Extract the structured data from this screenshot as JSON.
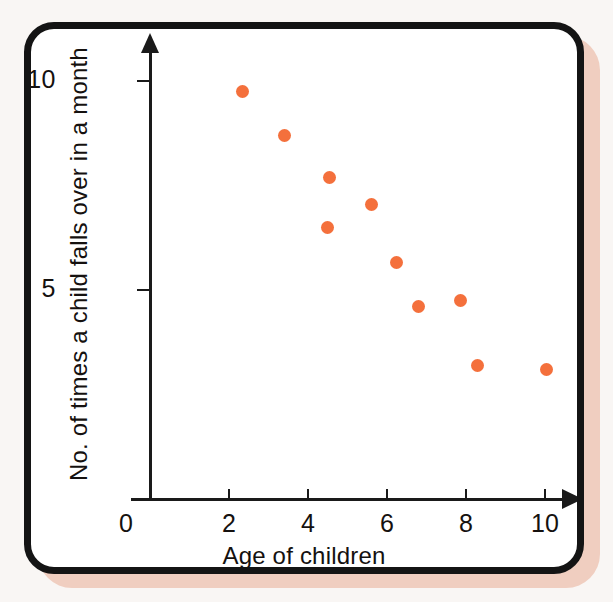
{
  "figure": {
    "frame_color": "#141414",
    "shadow_color": "#f0cec0",
    "background_color": "#f9f6f4",
    "plot_background": "#ffffff"
  },
  "chart_data": {
    "type": "scatter",
    "title": "",
    "xlabel": "Age of children",
    "ylabel": "No. of times a child falls over in a month",
    "xlim": [
      0,
      11.2
    ],
    "ylim": [
      0,
      10.8
    ],
    "xticks": [
      0,
      2,
      4,
      6,
      8,
      10
    ],
    "xticklabels": [
      "0",
      "2",
      "4",
      "6",
      "8",
      "10"
    ],
    "yticks": [
      5,
      10
    ],
    "yticklabels": [
      "5",
      "10"
    ],
    "grid": false,
    "legend": false,
    "marker_color": "#f4703c",
    "marker_shape": "circle",
    "series": [
      {
        "name": "children",
        "points": [
          {
            "x": 2.35,
            "y": 9.75
          },
          {
            "x": 3.4,
            "y": 8.7
          },
          {
            "x": 4.55,
            "y": 7.7
          },
          {
            "x": 4.5,
            "y": 6.5
          },
          {
            "x": 5.6,
            "y": 7.05
          },
          {
            "x": 6.25,
            "y": 5.65
          },
          {
            "x": 6.8,
            "y": 4.6
          },
          {
            "x": 7.85,
            "y": 4.75
          },
          {
            "x": 8.3,
            "y": 3.2
          },
          {
            "x": 10.05,
            "y": 3.1
          }
        ]
      }
    ]
  }
}
